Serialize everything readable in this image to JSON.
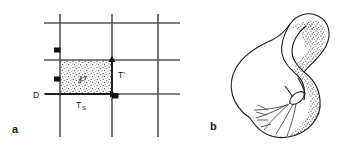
{
  "figure": {
    "width": 347,
    "height": 151,
    "background": "#ffffff",
    "ink_color": "#1d1d1d",
    "grid_color": "#55555a"
  },
  "panels": [
    {
      "id": "a",
      "label": "a",
      "kind": "grid-diagram",
      "description": "Rectangular stippled region P on a square grid with labelled translation vectors",
      "grid": {
        "vertical_lines_x": [
          60,
          112,
          158
        ],
        "horizontal_lines_y": [
          23,
          60,
          94
        ],
        "color": "#55555a"
      },
      "region": {
        "name": "P",
        "symbol": "℘",
        "x": 60,
        "y": 60,
        "width": 52,
        "height": 34,
        "fill": "stipple"
      },
      "labels": [
        {
          "name": "region-label",
          "text": "℘",
          "x": 82,
          "y": 79
        },
        {
          "name": "d-label",
          "text": "D",
          "x": 38,
          "y": 97
        },
        {
          "name": "ts-label",
          "text": "T",
          "sub": "S",
          "x": 79,
          "y": 108
        },
        {
          "name": "tprime-label",
          "text": "T'",
          "x": 119,
          "y": 76
        }
      ],
      "markers": [
        {
          "name": "corner-marker-upper",
          "x": 57,
          "y": 50
        },
        {
          "name": "corner-marker-left",
          "x": 57,
          "y": 79
        },
        {
          "name": "corner-marker-lower-right",
          "x": 114,
          "y": 95
        }
      ],
      "arrows": [
        {
          "name": "arrow-ts",
          "from": [
            60,
            94
          ],
          "to": [
            112,
            94
          ],
          "label": "T_S"
        },
        {
          "name": "arrow-tprime",
          "from": [
            112,
            94
          ],
          "to": [
            112,
            60
          ],
          "label": "T'"
        },
        {
          "name": "arrow-d",
          "from": [
            33,
            94
          ],
          "to": [
            60,
            94
          ],
          "label": "D"
        }
      ]
    },
    {
      "id": "b",
      "label": "b",
      "kind": "surface-drawing",
      "description": "Klein-bottle style self-intersecting closed surface, stippled shading on the right and lower edge, fan of short lines inside the lower bulb"
    }
  ]
}
